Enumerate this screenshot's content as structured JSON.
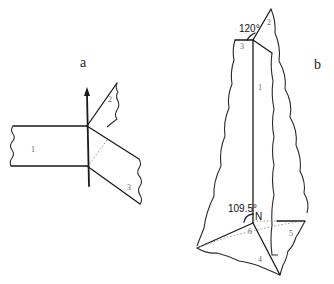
{
  "figure": {
    "panel_a": {
      "label": "a",
      "plane_labels": [
        "1",
        "2",
        "3"
      ]
    },
    "panel_b": {
      "label": "b",
      "angle_top": "120°",
      "angle_bottom": "109.5°",
      "vertex_label": "N",
      "face_labels": [
        "1",
        "2",
        "3",
        "4",
        "5",
        "6"
      ]
    }
  },
  "colors": {
    "line": "#1a1a1a",
    "dotted": "#888888",
    "background": "#ffffff"
  }
}
